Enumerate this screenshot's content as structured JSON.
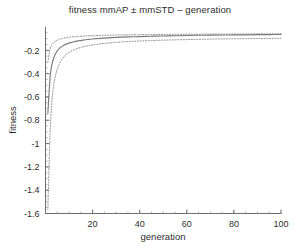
{
  "figure": {
    "background_color": "#ffffff",
    "width": 300,
    "height": 248
  },
  "chart_data": {
    "type": "line",
    "title": "fitness mmAP ± mmSTD – generation",
    "xlabel": "generation",
    "ylabel": "fitness",
    "xlim": [
      0,
      100
    ],
    "ylim": [
      -1.6,
      0.0
    ],
    "grid": false,
    "legend": false,
    "legend_position": "none",
    "xticks": [
      20,
      40,
      60,
      80,
      100
    ],
    "xtick_labels": [
      "20",
      "40",
      "60",
      "80",
      "100"
    ],
    "yticks": [
      -0.2,
      -0.4,
      -0.6,
      -0.8,
      -1,
      -1.2,
      -1.4,
      -1.6
    ],
    "ytick_labels": [
      "-0.2",
      "-0.4",
      "-0.6",
      "-0.8",
      "-1",
      "-1.2",
      "-1.4",
      "-1.6"
    ],
    "x": [
      1,
      2,
      3,
      4,
      5,
      6,
      7,
      8,
      9,
      10,
      12,
      14,
      16,
      18,
      20,
      25,
      30,
      35,
      40,
      45,
      50,
      55,
      60,
      65,
      70,
      75,
      80,
      85,
      90,
      95,
      100
    ],
    "series": [
      {
        "name": "mmAP",
        "style": "solid",
        "color": "#7a7a7a",
        "values": [
          -0.74,
          -0.42,
          -0.3,
          -0.24,
          -0.205,
          -0.182,
          -0.166,
          -0.154,
          -0.145,
          -0.138,
          -0.126,
          -0.118,
          -0.112,
          -0.107,
          -0.103,
          -0.095,
          -0.089,
          -0.085,
          -0.082,
          -0.079,
          -0.077,
          -0.075,
          -0.073,
          -0.071,
          -0.07,
          -0.069,
          -0.068,
          -0.067,
          -0.066,
          -0.065,
          -0.064
        ]
      },
      {
        "name": "mmAP + mmSTD",
        "style": "dotted",
        "color": "#8a8a8a",
        "values": [
          -0.3,
          -0.185,
          -0.145,
          -0.125,
          -0.113,
          -0.105,
          -0.099,
          -0.095,
          -0.091,
          -0.088,
          -0.084,
          -0.081,
          -0.078,
          -0.076,
          -0.075,
          -0.071,
          -0.069,
          -0.067,
          -0.066,
          -0.065,
          -0.064,
          -0.063,
          -0.062,
          -0.062,
          -0.061,
          -0.061,
          -0.06,
          -0.06,
          -0.059,
          -0.059,
          -0.058
        ]
      },
      {
        "name": "mmAP − mmSTD",
        "style": "dotted",
        "color": "#8a8a8a",
        "values": [
          -1.57,
          -0.88,
          -0.58,
          -0.44,
          -0.362,
          -0.312,
          -0.277,
          -0.252,
          -0.233,
          -0.218,
          -0.196,
          -0.181,
          -0.17,
          -0.161,
          -0.154,
          -0.141,
          -0.132,
          -0.125,
          -0.12,
          -0.116,
          -0.113,
          -0.11,
          -0.108,
          -0.106,
          -0.104,
          -0.102,
          -0.101,
          -0.1,
          -0.099,
          -0.098,
          -0.097
        ]
      }
    ]
  },
  "axes": {
    "axis_color": "#6f6f6f",
    "tick_color": "#6f6f6f"
  }
}
